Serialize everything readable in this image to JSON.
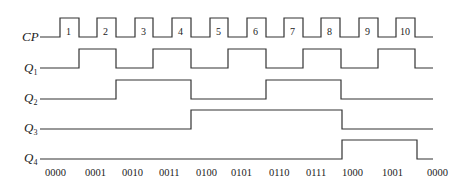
{
  "diagram": {
    "type": "timing-diagram",
    "signals": [
      {
        "name": "CP",
        "label": "CP",
        "subscript": ""
      },
      {
        "name": "Q1",
        "label": "Q",
        "subscript": "1"
      },
      {
        "name": "Q2",
        "label": "Q",
        "subscript": "2"
      },
      {
        "name": "Q3",
        "label": "Q",
        "subscript": "3"
      },
      {
        "name": "Q4",
        "label": "Q",
        "subscript": "4"
      }
    ],
    "clock_pulses": [
      "1",
      "2",
      "3",
      "4",
      "5",
      "6",
      "7",
      "8",
      "9",
      "10"
    ],
    "states": [
      "0000",
      "0001",
      "0010",
      "0011",
      "0100",
      "0101",
      "0110",
      "0111",
      "1000",
      "1001",
      "0000"
    ]
  }
}
